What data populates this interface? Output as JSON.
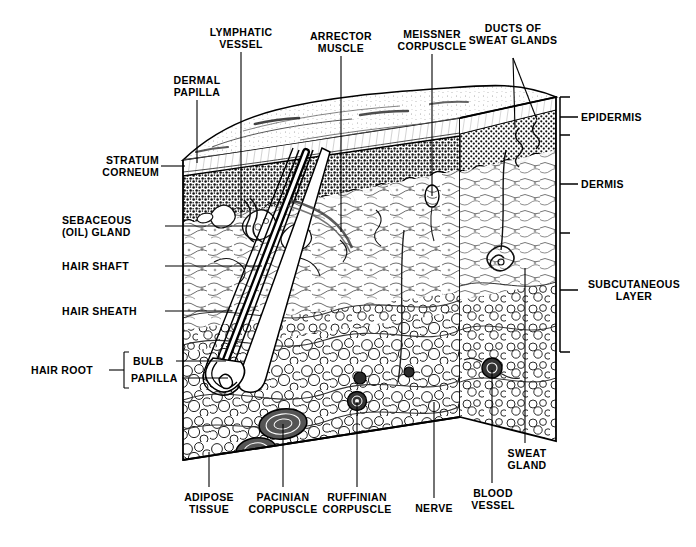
{
  "diagram": {
    "ink_color": "#000000",
    "background_color": "#ffffff",
    "layers_bracket": [
      {
        "id": "epidermis",
        "label": "EPIDERMIS"
      },
      {
        "id": "dermis",
        "label": "DERMIS"
      },
      {
        "id": "subcutaneous",
        "label": "SUBCUTANEOUS\nLAYER"
      }
    ],
    "labels": {
      "lymphatic_vessel": "LYMPHATIC\nVESSEL",
      "arrector_muscle": "ARRECTOR\nMUSCLE",
      "meissner_corpuscle": "MEISSNER\nCORPUSCLE",
      "ducts_of_sweat_glands": "DUCTS OF\nSWEAT GLANDS",
      "dermal_papilla": "DERMAL\nPAPILLA",
      "stratum_corneum": "STRATUM\nCORNEUM",
      "sebaceous_gland": "SEBACEOUS\n(OIL) GLAND",
      "hair_shaft": "HAIR SHAFT",
      "hair_sheath": "HAIR SHEATH",
      "hair_root": "HAIR ROOT",
      "bulb": "BULB",
      "papilla": "PAPILLA",
      "adipose_tissue": "ADIPOSE\nTISSUE",
      "pacinian_corpuscle": "PACINIAN\nCORPUSCLE",
      "ruffinian_corpuscle": "RUFFINIAN\nCORPUSCLE",
      "nerve": "NERVE",
      "blood_vessel": "BLOOD\nVESSEL",
      "sweat_gland": "SWEAT\nGLAND",
      "epidermis": "EPIDERMIS",
      "dermis": "DERMIS",
      "subcutaneous_layer": "SUBCUTANEOUS\nLAYER"
    }
  }
}
